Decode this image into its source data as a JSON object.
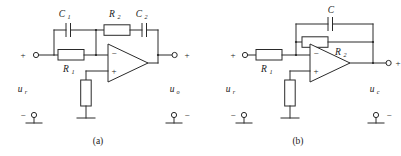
{
  "figure": {
    "kind": "electronic-schematic",
    "line_color": "#2a2a2a",
    "background": "#ffffff"
  },
  "circuits": [
    {
      "id": "a",
      "caption": "(a)",
      "input_terminal": {
        "polarity_top": "+",
        "polarity_bottom": "−"
      },
      "output_terminal": {
        "polarity_top": "+",
        "polarity_bottom": "−"
      },
      "input_label": {
        "base": "u",
        "sub": "r"
      },
      "output_label": {
        "base": "u",
        "sub": "o"
      },
      "opamp": {
        "inverting_sign": "−",
        "noninverting_sign": "+"
      },
      "components": [
        {
          "name": "C1",
          "base": "C",
          "sub": "1",
          "type": "capacitor",
          "orientation": "horizontal"
        },
        {
          "name": "R1",
          "base": "R",
          "sub": "1",
          "type": "resistor",
          "orientation": "horizontal"
        },
        {
          "name": "R2",
          "base": "R",
          "sub": "2",
          "type": "resistor",
          "orientation": "horizontal"
        },
        {
          "name": "C2",
          "base": "C",
          "sub": "2",
          "type": "capacitor",
          "orientation": "horizontal"
        },
        {
          "name": "Rbias",
          "base": "",
          "sub": "",
          "type": "resistor",
          "orientation": "vertical"
        }
      ]
    },
    {
      "id": "b",
      "caption": "(b)",
      "input_terminal": {
        "polarity_top": "+",
        "polarity_bottom": "−"
      },
      "output_terminal": {
        "polarity_top": "+",
        "polarity_bottom": "−"
      },
      "input_label": {
        "base": "u",
        "sub": "r"
      },
      "output_label": {
        "base": "u",
        "sub": "c"
      },
      "opamp": {
        "inverting_sign": "−",
        "noninverting_sign": "+"
      },
      "components": [
        {
          "name": "R1",
          "base": "R",
          "sub": "1",
          "type": "resistor",
          "orientation": "horizontal"
        },
        {
          "name": "C",
          "base": "C",
          "sub": "",
          "type": "capacitor",
          "orientation": "horizontal"
        },
        {
          "name": "R2",
          "base": "R",
          "sub": "2",
          "type": "resistor",
          "orientation": "horizontal"
        },
        {
          "name": "Rbias",
          "base": "",
          "sub": "",
          "type": "resistor",
          "orientation": "vertical"
        }
      ]
    }
  ]
}
